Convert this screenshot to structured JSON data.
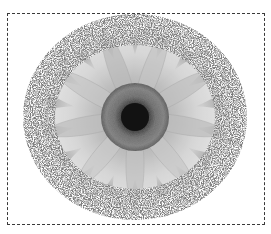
{
  "top_strip": {
    "text": "· ·· ··· ·· · ·····  · ·· ··  ·"
  },
  "canvas": {
    "subject": "gerbera daisy",
    "style": "grayscale photo with spattered circular frame",
    "selection": "dashed marquee border"
  },
  "colors": {
    "background": "#ffffff",
    "petal_light": "#e2e2e2",
    "petal_mid": "#b9b9b9",
    "petal_dark": "#8f8f8f",
    "disc_outer": "#6e6e6e",
    "disc_center": "#1a1a1a",
    "spatter": "#3c3c3c",
    "marquee": "#3a3a3a"
  }
}
